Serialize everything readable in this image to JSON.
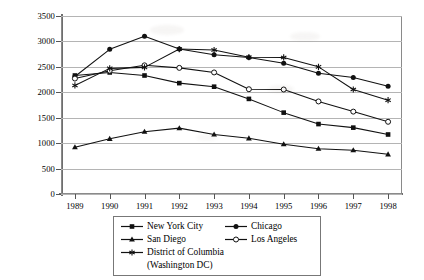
{
  "chart_data": {
    "type": "line",
    "title": "",
    "xlabel": "",
    "ylabel": "Per 100,000 Population",
    "x": [
      1989,
      1990,
      1991,
      1992,
      1993,
      1994,
      1995,
      1996,
      1997,
      1998
    ],
    "xtick_labels": [
      "1989",
      "1990",
      "1991",
      "1992",
      "1993",
      "1994",
      "1995",
      "1996",
      "1997",
      "1998"
    ],
    "ytick_labels": [
      "0",
      "500",
      "1000",
      "1500",
      "2000",
      "2500",
      "3000",
      "3500"
    ],
    "ytick_values": [
      0,
      500,
      1000,
      1500,
      2000,
      2500,
      3000,
      3500
    ],
    "ylim": [
      0,
      3500
    ],
    "xlim": [
      1988.6,
      1998.4
    ],
    "grid": "horizontal",
    "legend_position": "below-plot",
    "series": [
      {
        "name": "New York City",
        "marker": "filled-square",
        "values": [
          2330,
          2390,
          2330,
          2180,
          2110,
          1870,
          1600,
          1375,
          1305,
          1170
        ]
      },
      {
        "name": "Chicago",
        "marker": "filled-circle",
        "values": [
          2310,
          2845,
          3100,
          2850,
          2740,
          2685,
          2570,
          2375,
          2290,
          2120
        ]
      },
      {
        "name": "San Diego",
        "marker": "filled-triangle",
        "values": [
          920,
          1085,
          1225,
          1295,
          1170,
          1095,
          980,
          890,
          860,
          780
        ]
      },
      {
        "name": "Los Angeles",
        "marker": "open-circle",
        "values": [
          2270,
          2425,
          2530,
          2480,
          2390,
          2060,
          2055,
          1820,
          1620,
          1420
        ]
      },
      {
        "name": "District of Columbia (Washington DC)",
        "marker": "asterisk",
        "values": [
          2135,
          2470,
          2490,
          2850,
          2830,
          2690,
          2685,
          2500,
          2055,
          1845
        ]
      }
    ]
  },
  "legend": {
    "entries": [
      {
        "label": "New York City",
        "marker": "filled-square"
      },
      {
        "label": "Chicago",
        "marker": "filled-circle"
      },
      {
        "label": "San Diego",
        "marker": "filled-triangle"
      },
      {
        "label": "Los Angeles",
        "marker": "open-circle"
      },
      {
        "label": "District of Columbia",
        "marker": "asterisk"
      }
    ],
    "continuation_line": "(Washington DC)"
  },
  "colors": {
    "line": "#111111",
    "grid": "#b4b4b4",
    "frame": "#8a8a8a",
    "axis": "#666666",
    "text": "#000000",
    "background": "#ffffff"
  }
}
